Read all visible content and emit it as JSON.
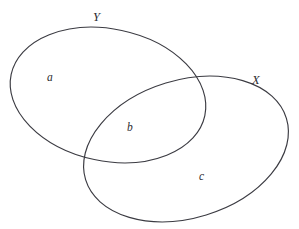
{
  "diagram": {
    "type": "venn",
    "title": "",
    "background_color": "#ffffff",
    "stroke_color": "#3b3b42",
    "sets": [
      {
        "id": "Y",
        "label": "Y",
        "position": "upper-left",
        "center": [
          108,
          95
        ],
        "radius_x": 99,
        "radius_y": 66,
        "rotation_deg": 12
      },
      {
        "id": "X",
        "label": "X",
        "position": "lower-right",
        "center": [
          186,
          149
        ],
        "radius_x": 105,
        "radius_y": 69,
        "rotation_deg": -17
      }
    ],
    "regions": [
      {
        "id": "a",
        "label": "a",
        "belongs_to": "Y only",
        "center": [
          51,
          78
        ]
      },
      {
        "id": "b",
        "label": "b",
        "belongs_to": "X and Y overlap",
        "center": [
          131,
          128
        ]
      },
      {
        "id": "c",
        "label": "c",
        "belongs_to": "X only",
        "center": [
          203,
          177
        ]
      }
    ]
  }
}
